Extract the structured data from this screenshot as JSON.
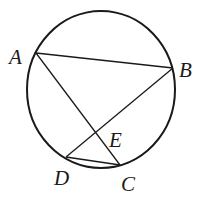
{
  "diagram": {
    "type": "circle-geometry",
    "circle": {
      "cx": 101,
      "cy": 89.5,
      "rx": 74,
      "ry": 78.5
    },
    "points": {
      "A": {
        "label": "A",
        "x": 36,
        "y": 53
      },
      "B": {
        "label": "B",
        "x": 173,
        "y": 68
      },
      "C": {
        "label": "C",
        "x": 120,
        "y": 165
      },
      "D": {
        "label": "D",
        "x": 66,
        "y": 157
      },
      "E": {
        "label": "E",
        "x": 96,
        "y": 133
      }
    },
    "segments": [
      "AB",
      "AC",
      "BD",
      "DC"
    ],
    "labels": {
      "A": "A",
      "B": "B",
      "C": "C",
      "D": "D",
      "E": "E"
    },
    "stroke_color": "#1a1a1a"
  }
}
